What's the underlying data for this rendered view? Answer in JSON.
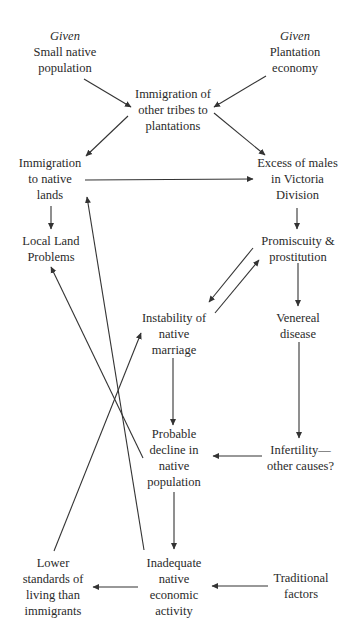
{
  "diagram": {
    "type": "causal-flow-diagram",
    "nodes": {
      "small_native_population": {
        "qualifier": "Given",
        "lines": [
          "Small native",
          "population"
        ]
      },
      "plantation_economy": {
        "qualifier": "Given",
        "lines": [
          "Plantation",
          "economy"
        ]
      },
      "immigration_other_tribes": {
        "lines": [
          "Immigration of",
          "other tribes to",
          "plantations"
        ]
      },
      "immigration_native_lands": {
        "lines": [
          "Immigration",
          "to native",
          "lands"
        ]
      },
      "excess_of_males": {
        "lines": [
          "Excess of males",
          "in Victoria",
          "Division"
        ]
      },
      "local_land_problems": {
        "lines": [
          "Local Land",
          "Problems"
        ]
      },
      "promiscuity": {
        "lines": [
          "Promiscuity &",
          "prostitution"
        ]
      },
      "instability_marriage": {
        "lines": [
          "Instability of",
          "native",
          "marriage"
        ]
      },
      "venereal_disease": {
        "lines": [
          "Venereal",
          "disease"
        ]
      },
      "probable_decline": {
        "lines": [
          "Probable",
          "decline in",
          "native",
          "population"
        ]
      },
      "infertility": {
        "lines": [
          "Infertility—",
          "other causes?"
        ]
      },
      "lower_standards": {
        "lines": [
          "Lower",
          "standards of",
          "living than",
          "immigrants"
        ]
      },
      "inadequate_activity": {
        "lines": [
          "Inadequate",
          "native",
          "economic",
          "activity"
        ]
      },
      "traditional_factors": {
        "lines": [
          "Traditional",
          "factors"
        ]
      }
    },
    "edges": [
      {
        "from": "small_native_population",
        "to": "immigration_other_tribes"
      },
      {
        "from": "plantation_economy",
        "to": "immigration_other_tribes"
      },
      {
        "from": "immigration_other_tribes",
        "to": "immigration_native_lands"
      },
      {
        "from": "immigration_other_tribes",
        "to": "excess_of_males"
      },
      {
        "from": "immigration_native_lands",
        "to": "excess_of_males"
      },
      {
        "from": "immigration_native_lands",
        "to": "local_land_problems"
      },
      {
        "from": "excess_of_males",
        "to": "promiscuity"
      },
      {
        "from": "promiscuity",
        "to": "instability_marriage"
      },
      {
        "from": "instability_marriage",
        "to": "promiscuity"
      },
      {
        "from": "promiscuity",
        "to": "venereal_disease"
      },
      {
        "from": "venereal_disease",
        "to": "infertility"
      },
      {
        "from": "instability_marriage",
        "to": "probable_decline"
      },
      {
        "from": "infertility",
        "to": "probable_decline"
      },
      {
        "from": "probable_decline",
        "to": "local_land_problems"
      },
      {
        "from": "probable_decline",
        "to": "inadequate_activity"
      },
      {
        "from": "inadequate_activity",
        "to": "immigration_native_lands"
      },
      {
        "from": "inadequate_activity",
        "to": "lower_standards"
      },
      {
        "from": "lower_standards",
        "to": "instability_marriage"
      },
      {
        "from": "traditional_factors",
        "to": "inadequate_activity"
      }
    ],
    "colors": {
      "text": "#2a2a2a",
      "line": "#333333",
      "background": "#ffffff"
    }
  }
}
